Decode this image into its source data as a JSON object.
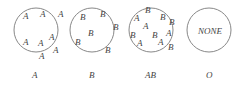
{
  "panels": [
    {
      "caption": "A",
      "circle": {
        "cx": 36,
        "cy": 30,
        "r": 22
      },
      "markers": [
        {
          "t": "A",
          "x": 23,
          "y": 19
        },
        {
          "t": "A",
          "x": 40,
          "y": 17
        },
        {
          "t": "A",
          "x": 58,
          "y": 17
        },
        {
          "t": "A",
          "x": 23,
          "y": 45
        },
        {
          "t": "A",
          "x": 38,
          "y": 46
        },
        {
          "t": "A",
          "x": 49,
          "y": 40
        },
        {
          "t": "A",
          "x": 53,
          "y": 53
        },
        {
          "t": "A",
          "x": 39,
          "y": 59
        }
      ]
    },
    {
      "caption": "B",
      "circle": {
        "cx": 92,
        "cy": 30,
        "r": 22
      },
      "markers": [
        {
          "t": "B",
          "x": 80,
          "y": 20
        },
        {
          "t": "B",
          "x": 100,
          "y": 17
        },
        {
          "t": "B",
          "x": 113,
          "y": 30
        },
        {
          "t": "B",
          "x": 88,
          "y": 36
        },
        {
          "t": "B",
          "x": 75,
          "y": 45
        },
        {
          "t": "B",
          "x": 105,
          "y": 53
        }
      ]
    },
    {
      "caption": "AB",
      "circle": {
        "cx": 151,
        "cy": 30,
        "r": 22
      },
      "markers": [
        {
          "t": "B",
          "x": 145,
          "y": 13
        },
        {
          "t": "A",
          "x": 134,
          "y": 21
        },
        {
          "t": "B",
          "x": 160,
          "y": 20
        },
        {
          "t": "B",
          "x": 169,
          "y": 25
        },
        {
          "t": "A",
          "x": 143,
          "y": 29
        },
        {
          "t": "B",
          "x": 152,
          "y": 38
        },
        {
          "t": "A",
          "x": 166,
          "y": 36
        },
        {
          "t": "B",
          "x": 130,
          "y": 38
        },
        {
          "t": "A",
          "x": 137,
          "y": 46
        },
        {
          "t": "A",
          "x": 158,
          "y": 45
        },
        {
          "t": "B",
          "x": 168,
          "y": 50
        }
      ]
    },
    {
      "caption": "O",
      "circle": {
        "cx": 209,
        "cy": 30,
        "r": 22
      },
      "markers": [
        {
          "t": "NONE",
          "x": 198,
          "y": 34
        }
      ]
    }
  ],
  "captions_y": 78,
  "colors": {
    "stroke": "#888888",
    "text": "#444444"
  }
}
